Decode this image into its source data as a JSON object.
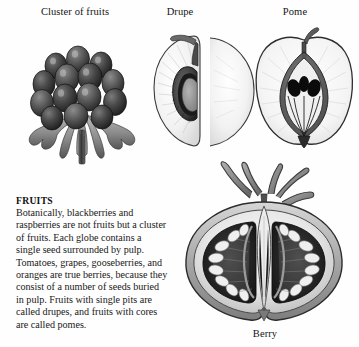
{
  "page": {
    "background_color": "#fefefe",
    "text_color": "#181818"
  },
  "figures": [
    {
      "id": "cluster",
      "caption": "Cluster of fruits",
      "icon": "blackberry-cluster-illustration",
      "subject": "blackberry aggregate fruit with sepals",
      "style": "engraving"
    },
    {
      "id": "drupe",
      "caption": "Drupe",
      "icon": "peach-cross-section-illustration",
      "subject": "peach halved showing single stony pit in pulp",
      "style": "engraving"
    },
    {
      "id": "pome",
      "caption": "Pome",
      "icon": "apple-cross-section-illustration",
      "subject": "apple halved showing core with black seeds",
      "style": "engraving"
    },
    {
      "id": "berry",
      "caption": "Berry",
      "icon": "tomato-cross-section-illustration",
      "subject": "tomato halved showing seed locules buried in pulp",
      "style": "engraving"
    }
  ],
  "article": {
    "heading": "FRUITS",
    "body": "Botanically, blackberries and raspberries are not fruits but a cluster of fruits. Each globe contains a single seed surrounded by pulp. Tomatoes, grapes, gooseberries, and oranges are true berries, because they consist of a number of seeds buried in pulp. Fruits with single pits are called drupes, and fruits with cores are called pomes."
  }
}
